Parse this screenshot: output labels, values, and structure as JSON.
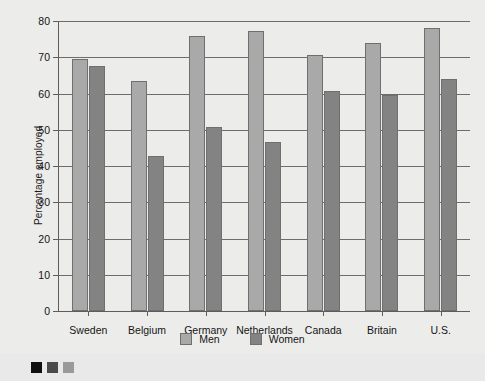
{
  "chart_data": {
    "type": "bar",
    "title": "",
    "xlabel": "",
    "ylabel": "Percentage employed",
    "ylim": [
      0,
      80
    ],
    "ytick_step": 10,
    "yticks": [
      "0",
      "10",
      "20",
      "30",
      "40",
      "50",
      "60",
      "70",
      "80"
    ],
    "grid": true,
    "legend_position": "bottom-center",
    "categories": [
      "Sweden",
      "Belgium",
      "Germany",
      "Netherlands",
      "Canada",
      "Britain",
      "U.S."
    ],
    "series": [
      {
        "name": "Men",
        "color": "#a9a9a9",
        "values": [
          69.4,
          63.4,
          76.0,
          77.3,
          70.7,
          73.8,
          78.2
        ]
      },
      {
        "name": "Women",
        "color": "#838383",
        "values": [
          67.6,
          42.8,
          50.7,
          46.6,
          60.8,
          59.6,
          64.0
        ]
      }
    ]
  },
  "legend": {
    "items": [
      {
        "label": "Men",
        "swatch": "men-swatch"
      },
      {
        "label": "Women",
        "swatch": "women-swatch"
      }
    ]
  },
  "calibration": {
    "chips": [
      "#100f0f",
      "#4b4b4b",
      "#9a9a9a"
    ]
  },
  "colors": {
    "background": "#ececeb",
    "strip": "#e9e9e9",
    "axis": "#5d5d5d",
    "grid": "#6c6c6c",
    "men": "#a9a9a9",
    "women": "#838383",
    "bar_outline": "#6f6f6f",
    "text": "#141414"
  }
}
